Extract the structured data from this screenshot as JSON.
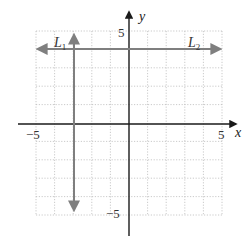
{
  "diagram": {
    "title": "",
    "type": "coordinate-plane",
    "x_axis": {
      "label": "x",
      "range": [
        -5,
        5
      ],
      "tick_labels": [
        {
          "value": -5,
          "text": "−5"
        },
        {
          "value": 5,
          "text": "5"
        }
      ]
    },
    "y_axis": {
      "label": "y",
      "range": [
        -5,
        5
      ],
      "tick_labels": [
        {
          "value": 5,
          "text": "5"
        },
        {
          "value": -5,
          "text": "−5"
        }
      ]
    },
    "grid": {
      "on": true,
      "step": 1,
      "style": "dotted"
    },
    "lines": [
      {
        "name": "L1",
        "main": "L",
        "sub": "1",
        "equation": "x = -3",
        "orientation": "vertical",
        "value": -3,
        "from": -4.8,
        "to": 4.8,
        "color": "#7f7f7f"
      },
      {
        "name": "L2",
        "main": "L",
        "sub": "2",
        "equation": "y = 4",
        "orientation": "horizontal",
        "value": 4,
        "from": -5.5,
        "to": 5.5,
        "color": "#7f7f7f"
      }
    ],
    "colors": {
      "axis": "#1a1a1a",
      "grid": "#bdbdbd",
      "line": "#7f7f7f"
    }
  }
}
